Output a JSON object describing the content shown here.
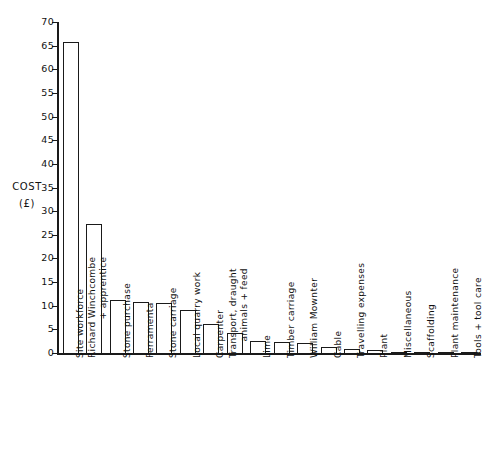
{
  "chart_data": {
    "type": "bar",
    "title": "",
    "xlabel": "",
    "ylabel": "COST",
    "ylabel_unit": "(£)",
    "ylim": [
      0,
      70
    ],
    "ytick_step": 5,
    "yticks": [
      0,
      5,
      10,
      15,
      20,
      25,
      30,
      35,
      40,
      45,
      50,
      55,
      60,
      65,
      70
    ],
    "ytick_labels": [
      "0",
      "5",
      "10",
      "15",
      "20",
      "25",
      "30",
      "35",
      "40",
      "45",
      "50",
      "55",
      "60",
      "65",
      "70"
    ],
    "grid": false,
    "legend": null,
    "bar_style": "open-outline-white-fill",
    "categories": [
      "Site workforce",
      "Richard Winchcombe + apprentice",
      "Stone purchase",
      "Ferramenta",
      "Stone carriage",
      "Local quarry work",
      "Carpenter",
      "Transport, draught animals + feed",
      "Lime",
      "Timber carriage",
      "William Mownter",
      "Cable",
      "Travelling expenses",
      "Plant",
      "Miscellaneous",
      "Scaffolding",
      "Plant maintenance",
      "Tools + tool care"
    ],
    "category_lines": [
      [
        "Site workforce"
      ],
      [
        "Richard Winchcombe",
        "+ apprentice"
      ],
      [
        "Stone purchase"
      ],
      [
        "Ferramenta"
      ],
      [
        "Stone carriage"
      ],
      [
        "Local quarry work"
      ],
      [
        "Carpenter"
      ],
      [
        "Transport, draught",
        "animals + feed"
      ],
      [
        "Lime"
      ],
      [
        "Timber carriage"
      ],
      [
        "William Mownter"
      ],
      [
        "Cable"
      ],
      [
        "Travelling expenses"
      ],
      [
        "Plant"
      ],
      [
        "Miscellaneous"
      ],
      [
        "Scaffolding"
      ],
      [
        "Plant maintenance"
      ],
      [
        "Tools + tool care"
      ]
    ],
    "values": [
      65.7,
      27.3,
      11.2,
      10.7,
      10.5,
      9.2,
      6.1,
      4.3,
      2.5,
      2.3,
      2.1,
      1.2,
      0.95,
      0.7,
      0.25,
      0.2,
      0.12,
      0.08
    ]
  },
  "colors": {
    "ink": "#1a1a1a",
    "background": "#ffffff"
  }
}
